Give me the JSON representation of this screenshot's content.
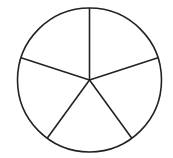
{
  "diagram": {
    "type": "divided-circle",
    "sectors": 5,
    "equal_parts": true,
    "center": [
      89.5,
      80
    ],
    "radius": 72,
    "stroke_color": "#222222",
    "fill_color": "#ffffff",
    "stroke_width": 1.6,
    "start_angle_deg": -90
  }
}
